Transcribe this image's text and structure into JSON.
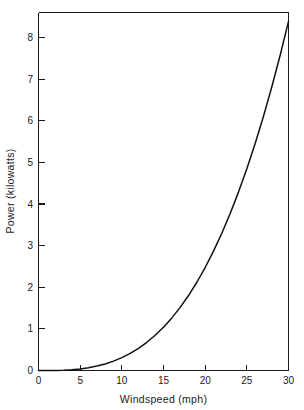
{
  "chart_data": {
    "type": "line",
    "title": "",
    "xlabel": "Windspeed  (mph)",
    "ylabel": "Power  (kilowatts)",
    "xlim": [
      0,
      30
    ],
    "ylim": [
      0,
      8.6
    ],
    "xticks": [
      0,
      5,
      10,
      15,
      20,
      25,
      30
    ],
    "xtick_labels": [
      "0",
      "5",
      "10",
      "15",
      "20",
      "25",
      "30"
    ],
    "yticks": [
      0,
      1,
      2,
      3,
      4,
      5,
      6,
      7,
      8
    ],
    "ytick_labels": [
      "0",
      "1",
      "2",
      "3",
      "4",
      "5",
      "6",
      "7",
      "8"
    ],
    "grid": false,
    "legend": false,
    "series": [
      {
        "name": "Power output",
        "color": "#111111",
        "x": [
          0,
          1,
          2,
          3,
          4,
          5,
          6,
          7,
          8,
          9,
          10,
          11,
          12,
          13,
          14,
          15,
          16,
          17,
          18,
          19,
          20,
          21,
          22,
          23,
          24,
          25,
          26,
          27,
          28,
          29,
          30
        ],
        "y": [
          0,
          0.0003,
          0.0025,
          0.0083,
          0.0197,
          0.0385,
          0.0665,
          0.1056,
          0.1578,
          0.2247,
          0.3083,
          0.4104,
          0.5329,
          0.6776,
          0.8464,
          1.041,
          1.264,
          1.517,
          1.801,
          2.12,
          2.474,
          2.866,
          3.297,
          3.77,
          4.285,
          4.846,
          5.453,
          6.109,
          6.815,
          7.573,
          8.386
        ]
      }
    ]
  },
  "axes": {
    "x_tick_labels": [
      "0",
      "5",
      "10",
      "15",
      "20",
      "25",
      "30"
    ],
    "y_tick_labels": [
      "0",
      "1",
      "2",
      "3",
      "4",
      "5",
      "6",
      "7",
      "8"
    ],
    "x_axis_title": "Windspeed  (mph)",
    "y_axis_title": "Power  (kilowatts)"
  },
  "colors": {
    "curve": "#111111",
    "axis": "#1a1a1a",
    "background": "#ffffff"
  }
}
